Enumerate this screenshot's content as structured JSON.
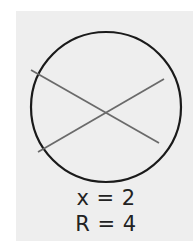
{
  "figure": {
    "type": "circle-with-intersecting-chords",
    "colors": {
      "background": "#ffffff",
      "panel": "#eeeeee",
      "circle_stroke": "#1a1a1a",
      "chord_stroke": "#6a6a6a",
      "text": "#222222"
    },
    "circle": {
      "cx": 106,
      "cy": 107,
      "r": 75
    },
    "chords": [
      {
        "x1": 31,
        "y1": 70,
        "x2": 159,
        "y2": 143
      },
      {
        "x1": 38,
        "y1": 152,
        "x2": 164,
        "y2": 79
      }
    ]
  },
  "labels": {
    "x_label": "x = 2",
    "r_label": "R = 4"
  }
}
